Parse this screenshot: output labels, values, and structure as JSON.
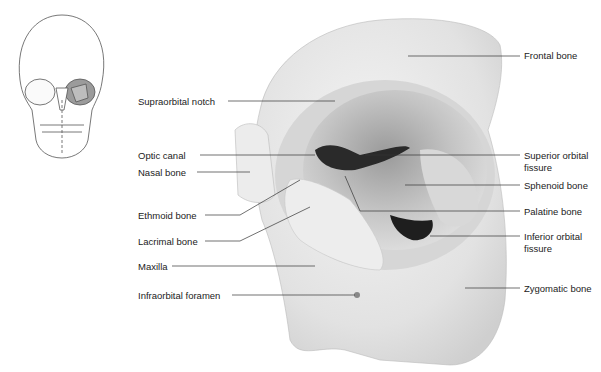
{
  "figure": {
    "inset": "Skull, anterior view with left orbit highlighted",
    "labels_left": [
      {
        "text": "Supraorbital notch",
        "x": 138,
        "y": 96
      },
      {
        "text": "Optic canal",
        "x": 138,
        "y": 150
      },
      {
        "text": "Nasal bone",
        "x": 138,
        "y": 167
      },
      {
        "text": "Ethmoid bone",
        "x": 138,
        "y": 210
      },
      {
        "text": "Lacrimal bone",
        "x": 138,
        "y": 236
      },
      {
        "text": "Maxilla",
        "x": 138,
        "y": 261
      },
      {
        "text": "Infraorbital foramen",
        "x": 138,
        "y": 290
      }
    ],
    "labels_right": [
      {
        "text": "Frontal bone",
        "x": 524,
        "y": 50
      },
      {
        "text": "Superior orbital",
        "x": 524,
        "y": 150
      },
      {
        "text": "fissure",
        "x": 524,
        "y": 162
      },
      {
        "text": "Sphenoid bone",
        "x": 524,
        "y": 180
      },
      {
        "text": "Palatine bone",
        "x": 524,
        "y": 206
      },
      {
        "text": "Inferior orbital",
        "x": 524,
        "y": 231
      },
      {
        "text": "fissure",
        "x": 524,
        "y": 243
      },
      {
        "text": "Zygomatic bone",
        "x": 524,
        "y": 283
      }
    ]
  }
}
